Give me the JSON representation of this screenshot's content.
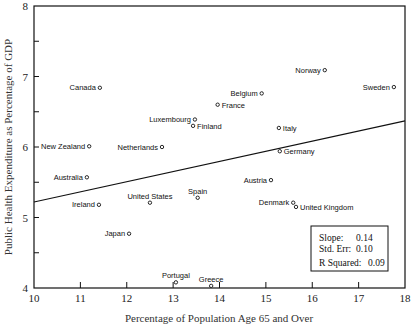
{
  "chart_data": {
    "type": "scatter",
    "title": "",
    "xlabel": "Percentage of Population Age 65 and Over",
    "ylabel": "Public Health Expenditure as Percentage of GDP",
    "xlim": [
      10,
      18
    ],
    "ylim": [
      4,
      8
    ],
    "xticks": [
      "10",
      "11",
      "12",
      "13",
      "14",
      "15",
      "16",
      "17",
      "18"
    ],
    "yticks": [
      "4",
      "5",
      "6",
      "7",
      "8"
    ],
    "grid": false,
    "points": [
      {
        "label": "Canada",
        "x": 11.42,
        "y": 6.84,
        "anchor": "left"
      },
      {
        "label": "Norway",
        "x": 16.27,
        "y": 7.09,
        "anchor": "left"
      },
      {
        "label": "Sweden",
        "x": 17.76,
        "y": 6.85,
        "anchor": "left"
      },
      {
        "label": "Belgium",
        "x": 14.91,
        "y": 6.76,
        "anchor": "left"
      },
      {
        "label": "France",
        "x": 13.96,
        "y": 6.6,
        "anchor": "right"
      },
      {
        "label": "Luxembourg",
        "x": 13.47,
        "y": 6.39,
        "anchor": "left"
      },
      {
        "label": "Finland",
        "x": 13.43,
        "y": 6.3,
        "anchor": "right"
      },
      {
        "label": "Italy",
        "x": 15.28,
        "y": 6.27,
        "anchor": "right"
      },
      {
        "label": "Germany",
        "x": 15.3,
        "y": 5.94,
        "anchor": "right"
      },
      {
        "label": "New Zealand",
        "x": 11.19,
        "y": 6.01,
        "anchor": "left"
      },
      {
        "label": "Netherlands",
        "x": 12.76,
        "y": 6.0,
        "anchor": "left"
      },
      {
        "label": "Australia",
        "x": 11.14,
        "y": 5.57,
        "anchor": "left"
      },
      {
        "label": "Austria",
        "x": 15.11,
        "y": 5.53,
        "anchor": "left"
      },
      {
        "label": "Spain",
        "x": 13.53,
        "y": 5.28,
        "anchor": "above"
      },
      {
        "label": "United States",
        "x": 12.5,
        "y": 5.21,
        "anchor": "above"
      },
      {
        "label": "Ireland",
        "x": 11.4,
        "y": 5.18,
        "anchor": "left"
      },
      {
        "label": "Denmark",
        "x": 15.59,
        "y": 5.21,
        "anchor": "left"
      },
      {
        "label": "United Kingdom",
        "x": 15.65,
        "y": 5.15,
        "anchor": "right"
      },
      {
        "label": "Japan",
        "x": 12.05,
        "y": 4.77,
        "anchor": "left"
      },
      {
        "label": "Portugal",
        "x": 13.06,
        "y": 4.08,
        "anchor": "above"
      },
      {
        "label": "Greece",
        "x": 13.82,
        "y": 4.03,
        "anchor": "above"
      }
    ],
    "regression_line": {
      "x": [
        10,
        18
      ],
      "y": [
        5.22,
        6.37
      ]
    },
    "stats": {
      "slope_label": "Slope:",
      "slope": "0.14",
      "stderr_label": "Std. Err:",
      "stderr": "0.10",
      "r2_label": "R Squared:",
      "r2": "0.09"
    }
  }
}
